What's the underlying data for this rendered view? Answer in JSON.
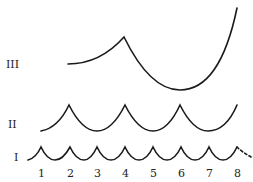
{
  "diagram": {
    "rows": [
      {
        "label": "III",
        "description": "one large arch spanning positions 2–8 with cusp at 4"
      },
      {
        "label": "II",
        "description": "arches with cusps at 2, 4, 6 and rising to 8"
      },
      {
        "label": "I",
        "description": "small arches with cusps at each of 1–8, dashed continuation after 8"
      }
    ],
    "x_ticks": [
      "1",
      "2",
      "3",
      "4",
      "5",
      "6",
      "7",
      "8"
    ]
  }
}
